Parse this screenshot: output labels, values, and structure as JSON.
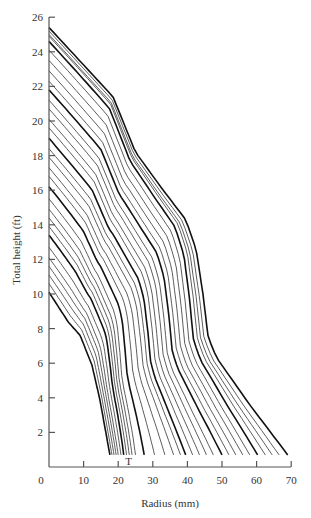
{
  "chart_data": {
    "type": "line",
    "title": "",
    "xlabel": "Radius (mm)",
    "ylabel": "Total height (ft)",
    "xlim": [
      0,
      70
    ],
    "ylim": [
      0,
      26
    ],
    "x_ticks": [
      0,
      10,
      20,
      30,
      40,
      50,
      60,
      70
    ],
    "y_ticks": [
      2,
      4,
      6,
      8,
      10,
      12,
      14,
      16,
      18,
      20,
      22,
      24,
      26
    ],
    "grid": false,
    "legend": null,
    "annotations": [
      {
        "text": "T",
        "x": 23,
        "y": 0.1
      }
    ],
    "profiles": {
      "inner": [
        [
          0,
          10.1
        ],
        [
          5.5,
          8.4
        ],
        [
          9,
          7.6
        ],
        [
          12.4,
          5.9
        ],
        [
          14.7,
          3.9
        ],
        [
          17.6,
          0.7
        ]
      ],
      "outer": [
        [
          0,
          25.4
        ],
        [
          18.5,
          21.4
        ],
        [
          25,
          18.2
        ],
        [
          33,
          16
        ],
        [
          39.5,
          14.3
        ],
        [
          42.5,
          12.6
        ],
        [
          44.5,
          10
        ],
        [
          46,
          7.5
        ],
        [
          48.5,
          6.3
        ],
        [
          58,
          3.6
        ],
        [
          69,
          0.7
        ]
      ]
    },
    "series": [
      {
        "name": "c1",
        "start_h": 10.1,
        "end_r": 17.6,
        "bold": true
      },
      {
        "name": "c2",
        "start_h": 10.6,
        "end_r": 18.2,
        "bold": false
      },
      {
        "name": "c3",
        "start_h": 11.1,
        "end_r": 18.8,
        "bold": false
      },
      {
        "name": "c4",
        "start_h": 11.6,
        "end_r": 19.4,
        "bold": false
      },
      {
        "name": "c5",
        "start_h": 12.1,
        "end_r": 20.0,
        "bold": false
      },
      {
        "name": "c6",
        "start_h": 12.7,
        "end_r": 20.8,
        "bold": false
      },
      {
        "name": "c7",
        "start_h": 13.4,
        "end_r": 21.6,
        "bold": true
      },
      {
        "name": "c8",
        "start_h": 13.9,
        "end_r": 22.4,
        "bold": false
      },
      {
        "name": "c9",
        "start_h": 14.4,
        "end_r": 23.2,
        "bold": false
      },
      {
        "name": "c10",
        "start_h": 14.9,
        "end_r": 24.0,
        "bold": false
      },
      {
        "name": "c11",
        "start_h": 15.5,
        "end_r": 25.0,
        "bold": false
      },
      {
        "name": "c12",
        "start_h": 16.2,
        "end_r": 27.5,
        "bold": true
      },
      {
        "name": "c13",
        "start_h": 16.8,
        "end_r": 30.5,
        "bold": false
      },
      {
        "name": "c14",
        "start_h": 17.3,
        "end_r": 33.5,
        "bold": false
      },
      {
        "name": "c15",
        "start_h": 17.9,
        "end_r": 36.0,
        "bold": false
      },
      {
        "name": "c16",
        "start_h": 18.4,
        "end_r": 38.0,
        "bold": false
      },
      {
        "name": "c17",
        "start_h": 19.0,
        "end_r": 39.5,
        "bold": true
      },
      {
        "name": "c18",
        "start_h": 19.6,
        "end_r": 41.5,
        "bold": false
      },
      {
        "name": "c19",
        "start_h": 20.1,
        "end_r": 43.5,
        "bold": false
      },
      {
        "name": "c20",
        "start_h": 20.7,
        "end_r": 45.5,
        "bold": false
      },
      {
        "name": "c21",
        "start_h": 21.2,
        "end_r": 47.5,
        "bold": false
      },
      {
        "name": "c22",
        "start_h": 21.8,
        "end_r": 50.0,
        "bold": true
      },
      {
        "name": "c23",
        "start_h": 22.3,
        "end_r": 52.0,
        "bold": false
      },
      {
        "name": "c24",
        "start_h": 22.9,
        "end_r": 54.0,
        "bold": false
      },
      {
        "name": "c25",
        "start_h": 23.5,
        "end_r": 56.0,
        "bold": false
      },
      {
        "name": "c26",
        "start_h": 24.1,
        "end_r": 58.0,
        "bold": false
      },
      {
        "name": "c27",
        "start_h": 24.6,
        "end_r": 60.3,
        "bold": true
      },
      {
        "name": "c28",
        "start_h": 24.9,
        "end_r": 62.5,
        "bold": false
      },
      {
        "name": "c29",
        "start_h": 25.0,
        "end_r": 64.5,
        "bold": false
      },
      {
        "name": "c30",
        "start_h": 25.2,
        "end_r": 66.5,
        "bold": false
      },
      {
        "name": "c31",
        "start_h": 25.4,
        "end_r": 69.0,
        "bold": true
      }
    ]
  }
}
